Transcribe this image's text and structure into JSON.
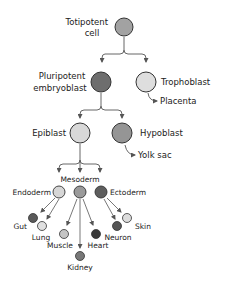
{
  "diagram": {
    "colors": {
      "dark": "#6a6a6a",
      "mid": "#9a9a9a",
      "light": "#d6d6d6",
      "verydark": "#444444",
      "stroke": "#333333",
      "arrow": "#555555"
    },
    "nodes": {
      "totipotent": {
        "label_line1": "Totipotent",
        "label_line2": "cell"
      },
      "pluripotent": {
        "label_line1": "Pluripotent",
        "label_line2": "embryoblast"
      },
      "trophoblast": {
        "label": "Trophoblast"
      },
      "placenta": {
        "label": "Placenta"
      },
      "epiblast": {
        "label": "Epiblast"
      },
      "hypoblast": {
        "label": "Hypoblast"
      },
      "yolk_sac": {
        "label": "Yolk sac"
      },
      "mesoderm": {
        "label": "Mesoderm"
      },
      "endoderm": {
        "label": "Endoderm"
      },
      "ectoderm": {
        "label": "Ectoderm"
      },
      "gut": {
        "label": "Gut"
      },
      "lung": {
        "label": "Lung"
      },
      "muscle": {
        "label": "Muscle"
      },
      "kidney": {
        "label": "Kidney"
      },
      "heart": {
        "label": "Heart"
      },
      "neuron": {
        "label": "Neuron"
      },
      "skin": {
        "label": "Skin"
      }
    }
  }
}
